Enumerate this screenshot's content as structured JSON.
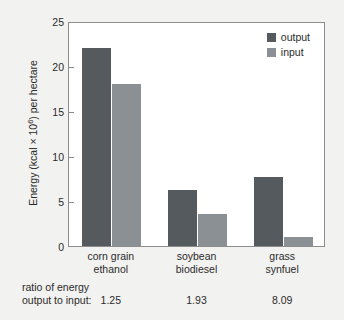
{
  "chart_data": {
    "type": "bar",
    "title": "",
    "xlabel": "",
    "ylabel_parts": {
      "pre": "Energy (kcal × 10",
      "sup": "6",
      "post": ") per hectare"
    },
    "ylabel": "Energy (kcal × 106) per hectare",
    "categories": [
      "corn grain ethanol",
      "soybean biodiesel",
      "grass synfuel"
    ],
    "category_lines": [
      [
        "corn grain",
        "ethanol"
      ],
      [
        "soybean",
        "biodiesel"
      ],
      [
        "grass",
        "synfuel"
      ]
    ],
    "series": [
      {
        "name": "output",
        "color": "#545a5e",
        "values": [
          22.0,
          6.2,
          7.7
        ]
      },
      {
        "name": "input",
        "color": "#8b9094",
        "values": [
          18.0,
          3.6,
          1.0
        ]
      }
    ],
    "ylim": [
      0,
      25
    ],
    "yticks": [
      0,
      5,
      10,
      15,
      20,
      25
    ],
    "ytick_labels": [
      "0",
      "5",
      "10",
      "15",
      "20",
      "25"
    ],
    "grid": false,
    "legend_position": "top-right",
    "annotations": {
      "ratio_caption_line1": "ratio of energy",
      "ratio_caption_line2": "output to input:",
      "ratio_values": [
        "1.25",
        "1.93",
        "8.09"
      ]
    }
  },
  "legend": {
    "entries": [
      {
        "label": "output",
        "color": "#545a5e"
      },
      {
        "label": "input",
        "color": "#8b9094"
      }
    ]
  },
  "colors": {
    "background": "#f2f2f0",
    "plot_background": "#ffffff",
    "axis": "#8d8d8d",
    "text": "#2b2b2b",
    "output": "#545a5e",
    "input": "#8b9094"
  }
}
